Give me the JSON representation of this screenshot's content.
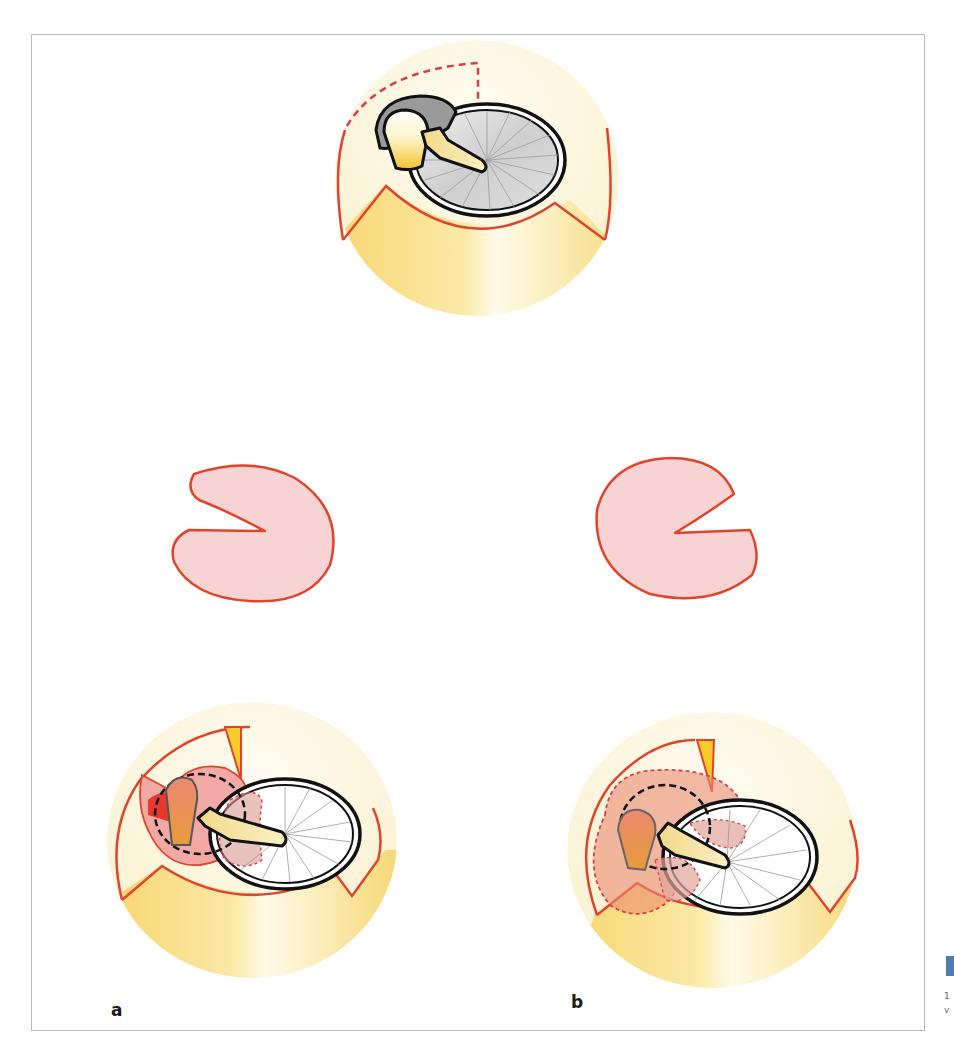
{
  "figure": {
    "panel_labels": {
      "a": "a",
      "b": "b"
    },
    "side_caption_fragment": {
      "line1": "1",
      "line2": "v"
    },
    "colors": {
      "outline_red": "#e0452b",
      "dashed_red": "#d6404a",
      "pink_fill": "#f7d3d3",
      "salmon_fill": "#e98a70",
      "bright_red": "#e8382e",
      "yellow_gradient_dark": "#f7d774",
      "yellow_gradient_light": "#fdf7dc",
      "disc_gray": "#c9c9c9",
      "paddle_yellow": "#f4e39a",
      "frame_gray": "#b8b8b8",
      "marker_blue": "#4a7fb0"
    },
    "elements": [
      "top-view-eye-with-dial",
      "left-kidney-shape",
      "right-kidney-shape",
      "panel-a-eye-with-dial",
      "panel-b-eye-with-dial"
    ]
  }
}
